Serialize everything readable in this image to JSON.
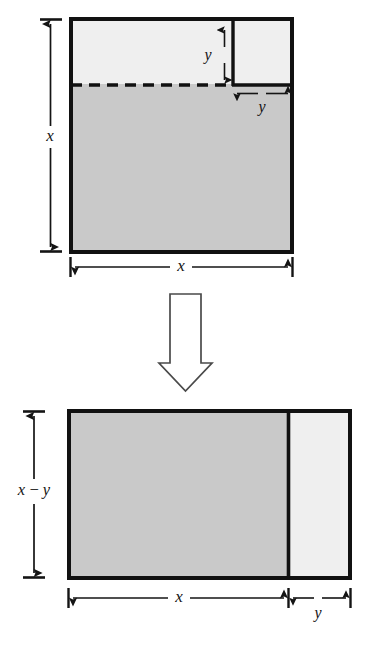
{
  "figure": {
    "background_color": "#ffffff",
    "stroke_color": "#111111",
    "gray_fill": "#c9c9c9",
    "light_fill": "#efefef",
    "arrow_outline_color": "#4a4a4a",
    "arrow_fill_color": "#ffffff"
  },
  "top_figure": {
    "name": "large-square-with-corner-square",
    "outer_square": {
      "label_width": "x",
      "label_height": "x",
      "fill": "#efefef"
    },
    "shaded_region": {
      "fill": "#c9c9c9"
    },
    "corner_square": {
      "label_side_vertical": "y",
      "label_side_horizontal": "y",
      "fill": "#efefef"
    },
    "dashed_line": {
      "style": "dashed"
    },
    "dimensions": {
      "height_label": "x",
      "width_label": "x",
      "corner_height_label": "y",
      "corner_width_label": "y"
    }
  },
  "transform_arrow": {
    "name": "downward-transform-arrow",
    "direction": "down"
  },
  "bottom_figure": {
    "name": "rearranged-rectangle",
    "shaded_region": {
      "fill": "#c9c9c9"
    },
    "light_region": {
      "fill": "#efefef"
    },
    "dimensions": {
      "height_label": "x − y",
      "width_label_left": "x",
      "width_label_right": "y"
    }
  }
}
